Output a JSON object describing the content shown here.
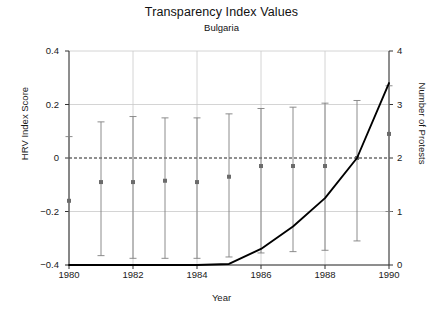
{
  "chart_data": {
    "type": "line",
    "title": "Transparency Index Values",
    "subtitle": "Bulgaria",
    "xlabel": "Year",
    "ylabel": "HRV Index Score",
    "ylabel_right": "Number of Protests",
    "xlim": [
      1980,
      1990
    ],
    "ylim": [
      -0.4,
      0.4
    ],
    "ylim_right": [
      0,
      4
    ],
    "xticks": [
      1980,
      1982,
      1984,
      1986,
      1988,
      1990
    ],
    "xtick_labels": [
      "1980",
      "1982",
      "1984",
      "1986",
      "1988",
      "1990"
    ],
    "yticks": [
      -0.4,
      -0.2,
      0,
      0.2,
      0.4
    ],
    "ytick_labels": [
      "-0.4",
      "-0.2",
      "0",
      "0.2",
      "0.4"
    ],
    "yticks_right": [
      0,
      1,
      2,
      3,
      4
    ],
    "ytick_labels_right": [
      "0",
      "1",
      "2",
      "3",
      "4"
    ],
    "grid": true,
    "legend": "none",
    "zero_reference_line": 0,
    "x": [
      1980,
      1981,
      1982,
      1983,
      1984,
      1985,
      1986,
      1987,
      1988,
      1989,
      1990
    ],
    "series": [
      {
        "name": "HRV Index Score",
        "axis": "left",
        "style": "point-with-errorbar",
        "color": "#808080",
        "values": [
          -0.16,
          -0.09,
          -0.09,
          -0.085,
          -0.09,
          -0.07,
          -0.03,
          -0.03,
          -0.03,
          0.0,
          0.09
        ],
        "error_low": [
          -0.4,
          -0.365,
          -0.375,
          -0.375,
          -0.375,
          -0.37,
          -0.355,
          -0.35,
          -0.345,
          -0.31,
          -0.2
        ],
        "error_high": [
          0.08,
          0.135,
          0.155,
          0.15,
          0.15,
          0.165,
          0.185,
          0.19,
          0.205,
          0.215,
          0.27
        ]
      },
      {
        "name": "Number of Protests",
        "axis": "right",
        "style": "line",
        "color": "#000000",
        "values": [
          0,
          0,
          0,
          0,
          0,
          0.02,
          0.3,
          0.72,
          1.25,
          2.0,
          3.4
        ]
      }
    ]
  }
}
